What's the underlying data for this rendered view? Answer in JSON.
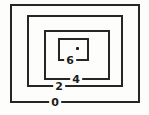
{
  "figure": {
    "kind": "contour-plot-of-nested-rectangular-level-curves",
    "background_color": "#fdfdfb",
    "line_color": "#262626",
    "label_color": "#1c1c1c"
  },
  "chart_data": {
    "type": "contour",
    "title": "",
    "shape": "nested-rectangles",
    "levels": [
      {
        "value": 0,
        "label": "0"
      },
      {
        "value": 2,
        "label": "2"
      },
      {
        "value": 4,
        "label": "4"
      },
      {
        "value": 6,
        "label": "6"
      }
    ],
    "level_order": "values increase inward toward the center",
    "center_marker": "dot",
    "legend": "none",
    "axes": "none",
    "grid": false
  }
}
